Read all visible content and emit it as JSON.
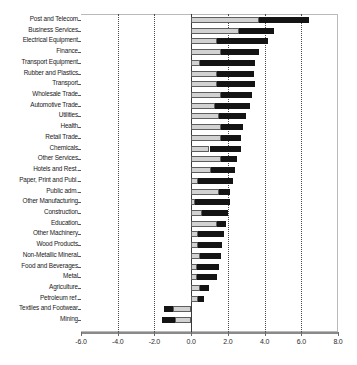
{
  "chart_data": {
    "type": "bar",
    "orientation": "horizontal",
    "stacked": true,
    "title": "",
    "subtitle": "",
    "xlabel": "",
    "ylabel": "",
    "xlim": [
      -6.0,
      8.0
    ],
    "xticks": [
      -6.0,
      -4.0,
      -2.0,
      0.0,
      2.0,
      4.0,
      6.0,
      8.0
    ],
    "xtick_labels": [
      "-6.0",
      "-4.0",
      "-2.0",
      "0.0",
      "2.0",
      "4.0",
      "6.0",
      "8.0"
    ],
    "grid": "vertical dotted gridlines at -4.0, -2.0, 2.0, 4.0, 6.0",
    "legend": "none",
    "categories": [
      "Post and Telecom",
      "Business Services",
      "Electrical Equipment",
      "Finance",
      "Transport Equipment",
      "Rubber and Plastics",
      "Transport",
      "Wholesale Trade",
      "Automotive Trade",
      "Utilities",
      "Health",
      "Retail Trade",
      "Chemicals",
      "Other Services",
      "Hotels and Rest.",
      "Paper, Print and Publ.",
      "Public adm.",
      "Other Manufacturing",
      "Construction",
      "Education",
      "Other Machinery",
      "Wood Products",
      "Non-Metallic Mineral",
      "Food and Beverages",
      "Metal",
      "Agriculture",
      "Petroleum ref.",
      "Textiles and Footwear",
      "Mining"
    ],
    "series": [
      {
        "name": "light-segment",
        "color": "#d2d2d2",
        "values": [
          3.7,
          2.6,
          1.4,
          1.6,
          0.5,
          1.4,
          1.4,
          1.6,
          1.3,
          1.5,
          1.6,
          1.6,
          1.0,
          1.6,
          1.1,
          0.4,
          1.5,
          0.2,
          0.6,
          1.4,
          0.4,
          0.4,
          0.5,
          0.3,
          0.3,
          0.5,
          0.4,
          -1.0,
          -0.9
        ]
      },
      {
        "name": "dark-segment",
        "color": "#141414",
        "values": [
          2.7,
          1.9,
          2.8,
          2.1,
          3.0,
          2.0,
          2.1,
          1.7,
          1.9,
          1.5,
          1.2,
          1.1,
          1.7,
          0.9,
          1.3,
          1.9,
          0.6,
          1.9,
          1.4,
          0.5,
          1.4,
          1.3,
          1.1,
          1.2,
          1.1,
          0.5,
          0.3,
          -0.5,
          -0.7
        ]
      }
    ],
    "totals": [
      6.4,
      4.5,
      4.2,
      3.7,
      3.5,
      3.4,
      3.5,
      3.3,
      3.2,
      3.0,
      2.8,
      2.7,
      2.7,
      2.5,
      2.4,
      2.3,
      2.1,
      2.1,
      2.0,
      1.9,
      1.8,
      1.7,
      1.6,
      1.5,
      1.4,
      1.0,
      0.7,
      -1.5,
      -1.6
    ]
  }
}
